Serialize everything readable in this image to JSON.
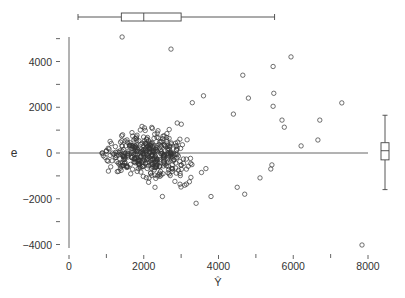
{
  "chart_data": {
    "type": "scatter",
    "title": "",
    "xlabel": "Ŷ",
    "ylabel": "e",
    "xlim": [
      0,
      8000
    ],
    "ylim": [
      -4000,
      5200
    ],
    "x_ticks": [
      0,
      2000,
      4000,
      6000,
      8000
    ],
    "x_tick_labels": [
      "0",
      "2000",
      "4000",
      "6000",
      "8000"
    ],
    "x_minor_ticks": [
      1000,
      3000,
      5000,
      7000
    ],
    "y_ticks": [
      -4000,
      -2000,
      0,
      2000,
      4000
    ],
    "y_tick_labels": [
      "-4000",
      "-2000",
      "0",
      "2000",
      "4000"
    ],
    "y_minor_ticks": [
      -3000,
      -1000,
      1000,
      3000
    ],
    "grid": false,
    "reference_line": {
      "y": 0,
      "x_from": 0,
      "x_to": 8000
    },
    "marginal_boxplot_x": {
      "whisker_low": 0,
      "q1": 1400,
      "median": 2000,
      "q3": 3000,
      "whisker_high": 5500
    },
    "marginal_boxplot_y": {
      "whisker_low": -1600,
      "q1": -300,
      "median": 100,
      "q3": 450,
      "whisker_high": 1650
    },
    "marker": "open-circle",
    "series": [
      {
        "name": "residuals",
        "outliers": [
          {
            "x": 1420,
            "y": 5070
          },
          {
            "x": 2730,
            "y": 4540
          },
          {
            "x": 5940,
            "y": 4200
          },
          {
            "x": 5460,
            "y": 3780
          },
          {
            "x": 5480,
            "y": 2610
          },
          {
            "x": 5460,
            "y": 2040
          },
          {
            "x": 5700,
            "y": 1440
          },
          {
            "x": 5760,
            "y": 1130
          },
          {
            "x": 7300,
            "y": 2190
          },
          {
            "x": 6710,
            "y": 1440
          },
          {
            "x": 6660,
            "y": 570
          },
          {
            "x": 6210,
            "y": 310
          },
          {
            "x": 5430,
            "y": -520
          },
          {
            "x": 5400,
            "y": -700
          },
          {
            "x": 5110,
            "y": -1090
          },
          {
            "x": 7840,
            "y": -4020
          },
          {
            "x": 4650,
            "y": 3400
          },
          {
            "x": 4400,
            "y": 1700
          },
          {
            "x": 4800,
            "y": 2400
          },
          {
            "x": 3300,
            "y": 2200
          },
          {
            "x": 3600,
            "y": 2500
          },
          {
            "x": 4700,
            "y": -1800
          },
          {
            "x": 4500,
            "y": -1500
          },
          {
            "x": 3400,
            "y": -2200
          },
          {
            "x": 2500,
            "y": -1900
          },
          {
            "x": 2300,
            "y": -1500
          },
          {
            "x": 3800,
            "y": -1900
          }
        ],
        "cluster": {
          "n": 420,
          "x_center": 2100,
          "x_spread": 1000,
          "x_min": 150,
          "x_max": 4600,
          "y_sd_base": 500,
          "y_sd_slope": 0.18
        }
      }
    ]
  }
}
